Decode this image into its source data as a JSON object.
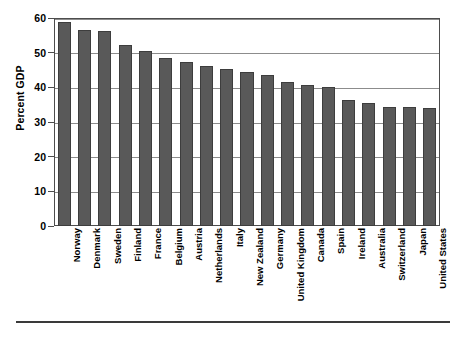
{
  "chart_data": {
    "type": "bar",
    "title": "",
    "subtitle": "",
    "xlabel": "",
    "ylabel": "Percent GDP",
    "ylim": [
      0,
      60
    ],
    "yticks": [
      0,
      10,
      20,
      30,
      40,
      50,
      60
    ],
    "ytick_labels": [
      "0",
      "10",
      "20",
      "30",
      "40",
      "50",
      "60"
    ],
    "grid": true,
    "legend": false,
    "legend_position": "none",
    "bar_color": "#595959",
    "bar_edge_color": "#3d3d3d",
    "gridline_color": "#8c8c8c",
    "frame_color": "#4d4d4d",
    "categories": [
      "Norway",
      "Denmark",
      "Sweden",
      "Finland",
      "France",
      "Belgium",
      "Austria",
      "Netherlands",
      "Italy",
      "New Zealand",
      "Germany",
      "United Kingdom",
      "Canada",
      "Spain",
      "Ireland",
      "Australia",
      "Switzerland",
      "Japan",
      "United States"
    ],
    "values": [
      58.8,
      56.4,
      56.3,
      52.3,
      50.4,
      48.6,
      47.4,
      46.1,
      45.3,
      44.5,
      43.5,
      41.4,
      40.6,
      40.1,
      36.4,
      35.5,
      34.4,
      34.3,
      34.1
    ]
  },
  "figure": {
    "bottom_rule": ""
  }
}
